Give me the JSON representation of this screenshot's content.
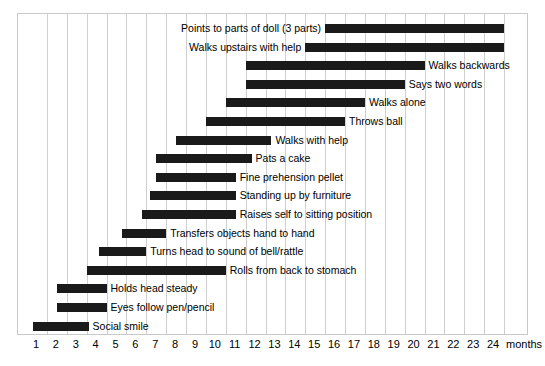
{
  "chart_data": {
    "type": "bar",
    "orientation": "horizontal",
    "subtype": "gantt-range",
    "title": "",
    "xlabel": "months",
    "ylabel": "",
    "xlim": [
      0,
      24
    ],
    "xticks": [
      1,
      2,
      3,
      4,
      5,
      6,
      7,
      8,
      9,
      10,
      11,
      12,
      13,
      14,
      15,
      16,
      17,
      18,
      19,
      20,
      21,
      22,
      23,
      24
    ],
    "xtick_labels": [
      "1",
      "2",
      "3",
      "4",
      "5",
      "6",
      "7",
      "8",
      "9",
      "10",
      "11",
      "12",
      "13",
      "14",
      "15",
      "16",
      "17",
      "18",
      "19",
      "20",
      "21",
      "22",
      "23",
      "24"
    ],
    "xaxis_unit_label": "months",
    "grid": true,
    "grid_axis": "x",
    "legend": false,
    "bar_color": "#1a1a1a",
    "grid_color": "#cfcfcf",
    "frame_color": "#c9c9c9",
    "background": "#ffffff",
    "categories": [
      "Points to parts of doll (3 parts)",
      "Walks upstairs with help",
      "Walks backwards",
      "Says two words",
      "Walks alone",
      "Throws ball",
      "Walks with help",
      "Pats a cake",
      "Fine prehension pellet",
      "Standing up by furniture",
      "Raises self to sitting position",
      "Transfers objects hand to hand",
      "Turns head to sound of bell/rattle",
      "Rolls from back to stomach",
      "Holds head steady",
      "Eyes follow pen/pencil",
      "Social smile"
    ],
    "bars": [
      {
        "label": "Points to parts of doll (3 parts)",
        "start": 15.0,
        "end": 24.0,
        "label_side": "left"
      },
      {
        "label": "Walks upstairs with help",
        "start": 14.0,
        "end": 24.0,
        "label_side": "left"
      },
      {
        "label": "Walks backwards",
        "start": 11.0,
        "end": 20.0,
        "label_side": "right"
      },
      {
        "label": "Says two words",
        "start": 11.0,
        "end": 19.0,
        "label_side": "right"
      },
      {
        "label": "Walks alone",
        "start": 10.0,
        "end": 17.0,
        "label_side": "right"
      },
      {
        "label": "Throws ball",
        "start": 9.0,
        "end": 16.0,
        "label_side": "right"
      },
      {
        "label": "Walks with help",
        "start": 7.5,
        "end": 12.3,
        "label_side": "right"
      },
      {
        "label": "Pats a cake",
        "start": 6.5,
        "end": 11.3,
        "label_side": "right"
      },
      {
        "label": "Fine prehension pellet",
        "start": 6.5,
        "end": 10.5,
        "label_side": "right"
      },
      {
        "label": "Standing up by furniture",
        "start": 6.2,
        "end": 10.5,
        "label_side": "right"
      },
      {
        "label": "Raises self to sitting position",
        "start": 5.8,
        "end": 10.5,
        "label_side": "right"
      },
      {
        "label": "Transfers objects hand to hand",
        "start": 4.8,
        "end": 7.0,
        "label_side": "right"
      },
      {
        "label": "Turns head to sound of bell/rattle",
        "start": 3.6,
        "end": 6.0,
        "label_side": "right"
      },
      {
        "label": "Rolls from back to stomach",
        "start": 3.0,
        "end": 10.0,
        "label_side": "right"
      },
      {
        "label": "Holds head steady",
        "start": 1.5,
        "end": 4.0,
        "label_side": "right"
      },
      {
        "label": "Eyes follow pen/pencil",
        "start": 1.5,
        "end": 4.0,
        "label_side": "right"
      },
      {
        "label": "Social smile",
        "start": 0.3,
        "end": 3.1,
        "label_side": "right"
      }
    ]
  }
}
